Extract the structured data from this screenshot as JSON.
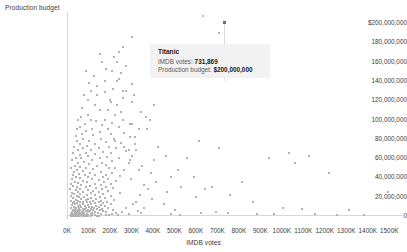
{
  "chart_data": {
    "type": "scatter",
    "title": "",
    "xlabel": "IMDB votes",
    "ylabel": "Production budget",
    "xlim": [
      0,
      1550000
    ],
    "ylim": [
      0,
      200000000
    ],
    "grid": false,
    "legend": null,
    "x_tick_labels": [
      "0K",
      "100K",
      "200K",
      "300K",
      "400K",
      "500K",
      "600K",
      "700K",
      "800K",
      "900K",
      "1000K",
      "1100K",
      "1200K",
      "1300K",
      "1400K",
      "1500K"
    ],
    "x_tick_values": [
      0,
      100000,
      200000,
      300000,
      400000,
      500000,
      600000,
      700000,
      800000,
      900000,
      1000000,
      1100000,
      1200000,
      1300000,
      1400000,
      1500000
    ],
    "y_tick_labels": [
      "$200,000,000",
      "180,000,000",
      "160,000,000",
      "140,000,000",
      "120,000,000",
      "100,000,000",
      "80,000,000",
      "60,000,000",
      "40,000,000",
      "20,000,000",
      "0"
    ],
    "y_tick_values": [
      200000000,
      180000000,
      160000000,
      140000000,
      120000000,
      100000000,
      80000000,
      60000000,
      40000000,
      20000000,
      0
    ],
    "point_color": "#b2b2b2",
    "highlight_color": "#6e6e6e",
    "highlighted_point": {
      "label": "Titanic",
      "x": 731869,
      "y": 200000000
    },
    "points": [
      [
        731869,
        200000000
      ],
      [
        705000,
        190000000
      ],
      [
        300000,
        185000000
      ],
      [
        258000,
        175000000
      ],
      [
        236000,
        170000000
      ],
      [
        156000,
        160000000
      ],
      [
        228000,
        160000000
      ],
      [
        271000,
        155000000
      ],
      [
        82000,
        150000000
      ],
      [
        206000,
        150000000
      ],
      [
        248000,
        148000000
      ],
      [
        539000,
        145000000
      ],
      [
        171000,
        140000000
      ],
      [
        229000,
        140000000
      ],
      [
        300000,
        137000000
      ],
      [
        137000,
        135000000
      ],
      [
        211000,
        132000000
      ],
      [
        258000,
        130000000
      ],
      [
        105000,
        130000000
      ],
      [
        171000,
        128000000
      ],
      [
        76000,
        125000000
      ],
      [
        135000,
        125000000
      ],
      [
        255000,
        122000000
      ],
      [
        195000,
        120000000
      ],
      [
        92000,
        120000000
      ],
      [
        300000,
        118000000
      ],
      [
        128000,
        115000000
      ],
      [
        226000,
        115000000
      ],
      [
        66000,
        112000000
      ],
      [
        184000,
        110000000
      ],
      [
        148000,
        110000000
      ],
      [
        340000,
        108000000
      ],
      [
        95000,
        105000000
      ],
      [
        220000,
        105000000
      ],
      [
        60000,
        103000000
      ],
      [
        172000,
        100000000
      ],
      [
        106000,
        100000000
      ],
      [
        258000,
        100000000
      ],
      [
        380000,
        100000000
      ],
      [
        45000,
        100000000
      ],
      [
        132000,
        98000000
      ],
      [
        205000,
        96000000
      ],
      [
        78000,
        95000000
      ],
      [
        300000,
        95000000
      ],
      [
        160000,
        94000000
      ],
      [
        58000,
        92000000
      ],
      [
        236000,
        92000000
      ],
      [
        112000,
        90000000
      ],
      [
        188000,
        90000000
      ],
      [
        40000,
        90000000
      ],
      [
        330000,
        90000000
      ],
      [
        85000,
        88000000
      ],
      [
        148000,
        87000000
      ],
      [
        262000,
        86000000
      ],
      [
        64000,
        85000000
      ],
      [
        198000,
        85000000
      ],
      [
        118000,
        84000000
      ],
      [
        35000,
        83000000
      ],
      [
        290000,
        82000000
      ],
      [
        155000,
        80000000
      ],
      [
        72000,
        80000000
      ],
      [
        215000,
        80000000
      ],
      [
        98000,
        78000000
      ],
      [
        42000,
        78000000
      ],
      [
        175000,
        77000000
      ],
      [
        245000,
        76000000
      ],
      [
        125000,
        75000000
      ],
      [
        58000,
        75000000
      ],
      [
        310000,
        75000000
      ],
      [
        88000,
        73000000
      ],
      [
        192000,
        72000000
      ],
      [
        30000,
        72000000
      ],
      [
        142000,
        70000000
      ],
      [
        68000,
        70000000
      ],
      [
        225000,
        70000000
      ],
      [
        105000,
        68000000
      ],
      [
        48000,
        68000000
      ],
      [
        268000,
        67000000
      ],
      [
        165000,
        66000000
      ],
      [
        82000,
        65000000
      ],
      [
        25000,
        65000000
      ],
      [
        198000,
        65000000
      ],
      [
        128000,
        64000000
      ],
      [
        55000,
        63000000
      ],
      [
        300000,
        62000000
      ],
      [
        92000,
        62000000
      ],
      [
        182000,
        61000000
      ],
      [
        38000,
        60000000
      ],
      [
        148000,
        60000000
      ],
      [
        62000,
        60000000
      ],
      [
        238000,
        60000000
      ],
      [
        112000,
        58000000
      ],
      [
        20000,
        58000000
      ],
      [
        205000,
        57000000
      ],
      [
        75000,
        56000000
      ],
      [
        158000,
        55000000
      ],
      [
        45000,
        55000000
      ],
      [
        285000,
        55000000
      ],
      [
        98000,
        54000000
      ],
      [
        175000,
        53000000
      ],
      [
        32000,
        52000000
      ],
      [
        135000,
        52000000
      ],
      [
        58000,
        51000000
      ],
      [
        218000,
        50000000
      ],
      [
        85000,
        50000000
      ],
      [
        16000,
        50000000
      ],
      [
        192000,
        50000000
      ],
      [
        118000,
        49000000
      ],
      [
        42000,
        48000000
      ],
      [
        262000,
        48000000
      ],
      [
        68000,
        47000000
      ],
      [
        152000,
        46000000
      ],
      [
        28000,
        46000000
      ],
      [
        102000,
        45000000
      ],
      [
        205000,
        45000000
      ],
      [
        52000,
        44000000
      ],
      [
        178000,
        43000000
      ],
      [
        128000,
        42000000
      ],
      [
        22000,
        42000000
      ],
      [
        78000,
        42000000
      ],
      [
        240000,
        41000000
      ],
      [
        95000,
        40000000
      ],
      [
        162000,
        40000000
      ],
      [
        38000,
        40000000
      ],
      [
        58000,
        39000000
      ],
      [
        188000,
        38000000
      ],
      [
        112000,
        38000000
      ],
      [
        18000,
        38000000
      ],
      [
        142000,
        37000000
      ],
      [
        70000,
        36000000
      ],
      [
        222000,
        36000000
      ],
      [
        88000,
        35000000
      ],
      [
        32000,
        35000000
      ],
      [
        168000,
        35000000
      ],
      [
        48000,
        34000000
      ],
      [
        125000,
        33000000
      ],
      [
        198000,
        33000000
      ],
      [
        14000,
        33000000
      ],
      [
        62000,
        32000000
      ],
      [
        152000,
        32000000
      ],
      [
        102000,
        31000000
      ],
      [
        25000,
        31000000
      ],
      [
        178000,
        30000000
      ],
      [
        42000,
        30000000
      ],
      [
        82000,
        30000000
      ],
      [
        132000,
        29000000
      ],
      [
        210000,
        29000000
      ],
      [
        56000,
        28000000
      ],
      [
        10000,
        28000000
      ],
      [
        158000,
        28000000
      ],
      [
        95000,
        27000000
      ],
      [
        35000,
        27000000
      ],
      [
        118000,
        26000000
      ],
      [
        185000,
        26000000
      ],
      [
        48000,
        25000000
      ],
      [
        70000,
        25000000
      ],
      [
        142000,
        25000000
      ],
      [
        20000,
        24000000
      ],
      [
        105000,
        24000000
      ],
      [
        240000,
        24000000
      ],
      [
        58000,
        23000000
      ],
      [
        162000,
        23000000
      ],
      [
        30000,
        23000000
      ],
      [
        88000,
        22000000
      ],
      [
        128000,
        22000000
      ],
      [
        42000,
        21000000
      ],
      [
        198000,
        21000000
      ],
      [
        12000,
        21000000
      ],
      [
        75000,
        20000000
      ],
      [
        148000,
        20000000
      ],
      [
        52000,
        20000000
      ],
      [
        108000,
        19000000
      ],
      [
        172000,
        19000000
      ],
      [
        25000,
        19000000
      ],
      [
        62000,
        18000000
      ],
      [
        132000,
        18000000
      ],
      [
        95000,
        18000000
      ],
      [
        38000,
        17000000
      ],
      [
        212000,
        17000000
      ],
      [
        82000,
        17000000
      ],
      [
        155000,
        16000000
      ],
      [
        16000,
        16000000
      ],
      [
        48000,
        16000000
      ],
      [
        118000,
        16000000
      ],
      [
        68000,
        15000000
      ],
      [
        182000,
        15000000
      ],
      [
        30000,
        15000000
      ],
      [
        102000,
        15000000
      ],
      [
        142000,
        14000000
      ],
      [
        55000,
        14000000
      ],
      [
        88000,
        14000000
      ],
      [
        22000,
        13000000
      ],
      [
        162000,
        13000000
      ],
      [
        125000,
        13000000
      ],
      [
        42000,
        13000000
      ],
      [
        72000,
        12000000
      ],
      [
        198000,
        12000000
      ],
      [
        108000,
        12000000
      ],
      [
        34000,
        12000000
      ],
      [
        152000,
        11000000
      ],
      [
        58000,
        11000000
      ],
      [
        92000,
        11000000
      ],
      [
        18000,
        11000000
      ],
      [
        132000,
        10000000
      ],
      [
        78000,
        10000000
      ],
      [
        45000,
        10000000
      ],
      [
        172000,
        10000000
      ],
      [
        112000,
        9500000
      ],
      [
        28000,
        9500000
      ],
      [
        62000,
        9000000
      ],
      [
        145000,
        9000000
      ],
      [
        98000,
        9000000
      ],
      [
        38000,
        8500000
      ],
      [
        85000,
        8500000
      ],
      [
        185000,
        8500000
      ],
      [
        52000,
        8000000
      ],
      [
        122000,
        8000000
      ],
      [
        14000,
        8000000
      ],
      [
        68000,
        7500000
      ],
      [
        158000,
        7500000
      ],
      [
        105000,
        7500000
      ],
      [
        32000,
        7000000
      ],
      [
        78000,
        7000000
      ],
      [
        135000,
        7000000
      ],
      [
        45000,
        6500000
      ],
      [
        92000,
        6500000
      ],
      [
        210000,
        6500000
      ],
      [
        22000,
        6000000
      ],
      [
        58000,
        6000000
      ],
      [
        118000,
        6000000
      ],
      [
        148000,
        6000000
      ],
      [
        72000,
        5500000
      ],
      [
        38000,
        5500000
      ],
      [
        102000,
        5500000
      ],
      [
        165000,
        5000000
      ],
      [
        52000,
        5000000
      ],
      [
        85000,
        5000000
      ],
      [
        26000,
        5000000
      ],
      [
        128000,
        4500000
      ],
      [
        65000,
        4500000
      ],
      [
        42000,
        4000000
      ],
      [
        95000,
        4000000
      ],
      [
        178000,
        4000000
      ],
      [
        18000,
        4000000
      ],
      [
        112000,
        3500000
      ],
      [
        55000,
        3500000
      ],
      [
        32000,
        3500000
      ],
      [
        75000,
        3000000
      ],
      [
        140000,
        3000000
      ],
      [
        48000,
        3000000
      ],
      [
        88000,
        2500000
      ],
      [
        24000,
        2500000
      ],
      [
        62000,
        2500000
      ],
      [
        105000,
        2000000
      ],
      [
        38000,
        2000000
      ],
      [
        155000,
        2000000
      ],
      [
        70000,
        1800000
      ],
      [
        15000,
        1800000
      ],
      [
        45000,
        1500000
      ],
      [
        95000,
        1500000
      ],
      [
        125000,
        1200000
      ],
      [
        55000,
        1200000
      ],
      [
        28000,
        1000000
      ],
      [
        80000,
        1000000
      ],
      [
        190000,
        1000000
      ],
      [
        38000,
        800000
      ],
      [
        110000,
        800000
      ],
      [
        62000,
        600000
      ],
      [
        20000,
        600000
      ],
      [
        145000,
        500000
      ],
      [
        48000,
        400000
      ],
      [
        88000,
        400000
      ],
      [
        30000,
        300000
      ],
      [
        70000,
        250000
      ],
      [
        12000,
        200000
      ],
      [
        105000,
        200000
      ],
      [
        52000,
        150000
      ],
      [
        25000,
        120000
      ],
      [
        135000,
        100000
      ],
      [
        40000,
        80000
      ],
      [
        78000,
        60000
      ],
      [
        18000,
        50000
      ],
      [
        95000,
        40000
      ],
      [
        58000,
        30000
      ],
      [
        32000,
        20000
      ],
      [
        420000,
        72000000
      ],
      [
        455000,
        62000000
      ],
      [
        398000,
        58000000
      ],
      [
        512000,
        48000000
      ],
      [
        368000,
        90000000
      ],
      [
        345000,
        52000000
      ],
      [
        480000,
        40000000
      ],
      [
        410000,
        35000000
      ],
      [
        528000,
        30000000
      ],
      [
        372000,
        28000000
      ],
      [
        462000,
        25000000
      ],
      [
        335000,
        22000000
      ],
      [
        555000,
        60000000
      ],
      [
        392000,
        18000000
      ],
      [
        318000,
        15000000
      ],
      [
        445000,
        12000000
      ],
      [
        610000,
        78000000
      ],
      [
        585000,
        40000000
      ],
      [
        352000,
        8000000
      ],
      [
        498000,
        6000000
      ],
      [
        325000,
        5000000
      ],
      [
        640000,
        28000000
      ],
      [
        702000,
        70000000
      ],
      [
        672000,
        30000000
      ],
      [
        752000,
        22000000
      ],
      [
        812000,
        35000000
      ],
      [
        362000,
        103000000
      ],
      [
        400000,
        115000000
      ],
      [
        288000,
        58000000
      ],
      [
        598000,
        20000000
      ],
      [
        860000,
        15000000
      ],
      [
        935000,
        60000000
      ],
      [
        1030000,
        65000000
      ],
      [
        1055000,
        55000000
      ],
      [
        1120000,
        62000000
      ],
      [
        1215000,
        45000000
      ],
      [
        1000000,
        8000000
      ],
      [
        1090000,
        7000000
      ],
      [
        1310000,
        6000000
      ],
      [
        1490000,
        25000000
      ],
      [
        478000,
        2000000
      ],
      [
        522000,
        1500000
      ],
      [
        620000,
        3000000
      ],
      [
        690000,
        4000000
      ],
      [
        745000,
        3000000
      ],
      [
        880000,
        2500000
      ],
      [
        960000,
        2000000
      ],
      [
        1150000,
        2000000
      ],
      [
        1250000,
        1500000
      ],
      [
        1380000,
        1000000
      ],
      [
        268000,
        8000000
      ],
      [
        302000,
        12000000
      ],
      [
        338000,
        3000000
      ],
      [
        282000,
        2000000
      ],
      [
        252000,
        4000000
      ],
      [
        222000,
        3000000
      ],
      [
        205000,
        2000000
      ],
      [
        192000,
        1500000
      ],
      [
        175000,
        1200000
      ],
      [
        232000,
        1000000
      ],
      [
        262000,
        72000000
      ],
      [
        288000,
        95000000
      ],
      [
        248000,
        108000000
      ],
      [
        218000,
        78000000
      ],
      [
        282000,
        68000000
      ],
      [
        312000,
        82000000
      ],
      [
        268000,
        130000000
      ],
      [
        305000,
        125000000
      ],
      [
        238000,
        142000000
      ],
      [
        198000,
        118000000
      ],
      [
        178000,
        152000000
      ],
      [
        215000,
        165000000
      ],
      [
        148000,
        168000000
      ],
      [
        122000,
        145000000
      ],
      [
        98000,
        138000000
      ],
      [
        330000,
        48000000
      ],
      [
        295000,
        38000000
      ],
      [
        352000,
        32000000
      ],
      [
        385000,
        45000000
      ],
      [
        318000,
        68000000
      ]
    ]
  },
  "tooltip": {
    "title": "Titanic",
    "rows": [
      {
        "label": "IMDB votes:",
        "value": "731,869"
      },
      {
        "label": "Production budget:",
        "value": "$200,000,000"
      }
    ]
  }
}
